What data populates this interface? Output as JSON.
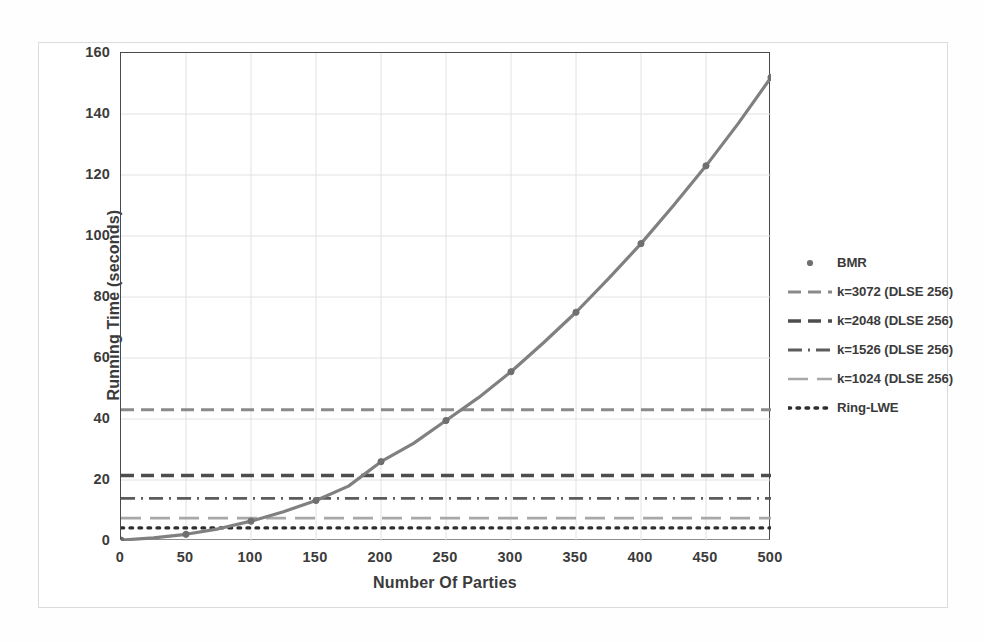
{
  "chart_data": {
    "type": "line",
    "title": "",
    "xlabel": "Number Of Parties",
    "ylabel": "Running Time (seconds)",
    "xlim": [
      0,
      500
    ],
    "ylim": [
      0,
      160
    ],
    "xticks": [
      0,
      50,
      100,
      150,
      200,
      250,
      300,
      350,
      400,
      450,
      500
    ],
    "yticks": [
      0,
      20,
      40,
      60,
      80,
      100,
      120,
      140,
      160
    ],
    "grid": true,
    "legend_position": "right",
    "series": [
      {
        "name": "BMR",
        "style": "line-with-markers",
        "color": "#808080",
        "x": [
          0,
          25,
          50,
          75,
          100,
          125,
          150,
          175,
          200,
          225,
          250,
          275,
          300,
          325,
          350,
          375,
          400,
          425,
          450,
          475,
          500
        ],
        "values": [
          0.3,
          1.0,
          2.2,
          4.0,
          6.5,
          9.6,
          13.3,
          18.0,
          26.0,
          32.0,
          39.5,
          47.0,
          55.5,
          65.0,
          75.0,
          86.0,
          97.5,
          110.0,
          123.0,
          137.0,
          152.0
        ],
        "marker_x": [
          0,
          50,
          100,
          150,
          200,
          250,
          300,
          350,
          400,
          450,
          500
        ],
        "marker_values": [
          0.3,
          2.2,
          6.5,
          13.3,
          26.0,
          39.5,
          55.5,
          75.0,
          97.5,
          123.0,
          152.0
        ]
      },
      {
        "name": "k=3072 (DLSE 256)",
        "style": "dashed",
        "color": "#8a8a8a",
        "constant_value": 43.0
      },
      {
        "name": "k=2048 (DLSE 256)",
        "style": "dashed-bold",
        "color": "#4d4d4d",
        "constant_value": 21.5
      },
      {
        "name": "k=1526 (DLSE 256)",
        "style": "dash-dot",
        "color": "#5c5c5c",
        "constant_value": 14.0
      },
      {
        "name": "k=1024 (DLSE 256)",
        "style": "long-dash-light",
        "color": "#a8a8a8",
        "constant_value": 7.5
      },
      {
        "name": "Ring-LWE",
        "style": "dotted",
        "color": "#2e2e2e",
        "constant_value": 4.3
      }
    ]
  },
  "legend": {
    "items": [
      {
        "label": "BMR",
        "key": "marker-dot"
      },
      {
        "label": "k=3072 (DLSE 256)",
        "key": "dashed-line"
      },
      {
        "label": "k=2048 (DLSE 256)",
        "key": "dashed-bold-line"
      },
      {
        "label": "k=1526 (DLSE 256)",
        "key": "dash-dot-line"
      },
      {
        "label": "k=1024 (DLSE 256)",
        "key": "long-dash-light-line"
      },
      {
        "label": "Ring-LWE",
        "key": "dotted-line"
      }
    ]
  },
  "axes": {
    "x_title": "Number Of Parties",
    "y_title": "Running Time (seconds)",
    "x_ticks": [
      "0",
      "50",
      "100",
      "150",
      "200",
      "250",
      "300",
      "350",
      "400",
      "450",
      "500"
    ],
    "y_ticks": [
      "0",
      "20",
      "40",
      "60",
      "80",
      "100",
      "120",
      "140",
      "160"
    ]
  },
  "colors": {
    "grid": "#e2e2e2",
    "axis": "#4a4a4a",
    "text": "#3b3b3b",
    "bmr": "#808080"
  }
}
